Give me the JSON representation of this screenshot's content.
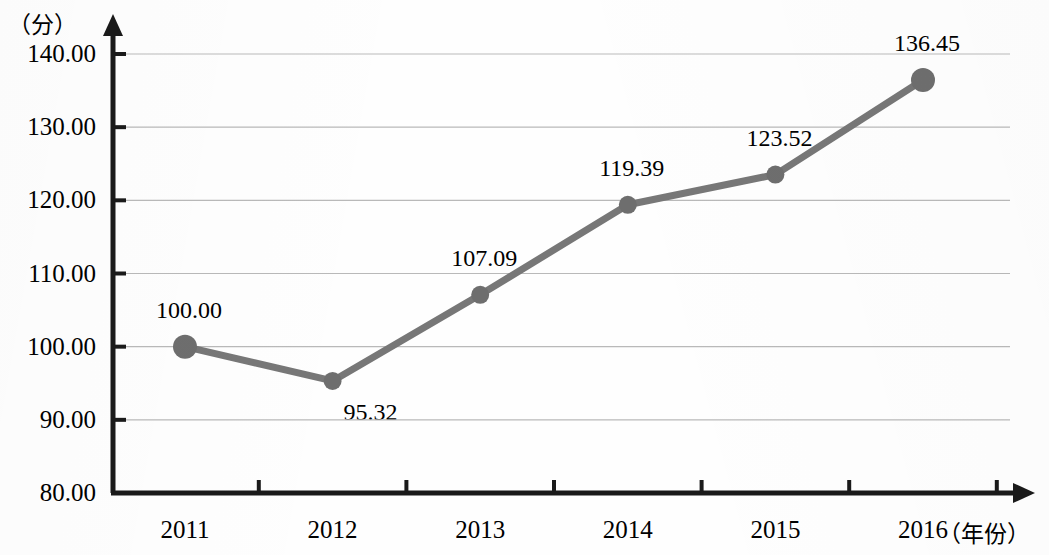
{
  "chart_data": {
    "type": "line",
    "title": "",
    "subtitle": "",
    "xlabel": "（年份）",
    "ylabel": "（分）",
    "categories": [
      "2011",
      "2012",
      "2013",
      "2014",
      "2015",
      "2016"
    ],
    "values": [
      100.0,
      95.32,
      107.09,
      119.39,
      123.52,
      136.45
    ],
    "point_labels": [
      "100.00",
      "95.32",
      "107.09",
      "119.39",
      "123.52",
      "136.45"
    ],
    "label_positions": [
      "above",
      "below",
      "above",
      "above",
      "above",
      "above"
    ],
    "ylim": [
      80,
      140
    ],
    "ytick_labels": [
      "140.00",
      "130.00",
      "120.00",
      "110.00",
      "100.00",
      "90.00",
      "80.00"
    ],
    "ytick_values": [
      140,
      130,
      120,
      110,
      100,
      90,
      80
    ],
    "grid": true,
    "legend": null,
    "series": [
      {
        "name": "",
        "values": [
          100.0,
          95.32,
          107.09,
          119.39,
          123.52,
          136.45
        ]
      }
    ],
    "colors": {
      "line": "#777777",
      "marker": "#6e6e6e",
      "axis": "#1a1a1a",
      "grid": "#b9b9b9",
      "text": "#111111"
    }
  }
}
